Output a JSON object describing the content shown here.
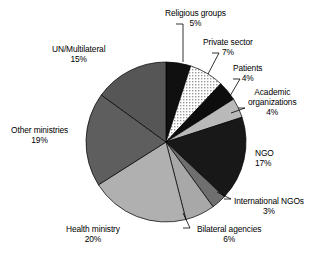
{
  "chart_data": {
    "type": "pie",
    "title": "",
    "subtitle": "",
    "xlabel": "",
    "ylabel": "",
    "legend_position": "none",
    "labels_position": "outside-with-leader-lines",
    "grid": false,
    "total_percent": 100,
    "start_angle_deg": 0,
    "direction": "clockwise",
    "categories": [
      "Religious groups",
      "Private sector",
      "Patients",
      "Academic organizations",
      "NGO",
      "International NGOs",
      "Bilateral agencies",
      "Health ministry",
      "Other ministries",
      "UN/Multilateral"
    ],
    "values": [
      5,
      7,
      4,
      4,
      17,
      3,
      6,
      20,
      19,
      15
    ],
    "value_labels": [
      "5%",
      "7%",
      "4%",
      "4%",
      "17%",
      "3%",
      "6%",
      "20%",
      "19%",
      "15%"
    ],
    "colors": [
      "#101010",
      "#e8e8e8",
      "#0d0d0d",
      "#b9b9b9",
      "#181818",
      "#6f6f6f",
      "#a8a8a8",
      "#b0b0b0",
      "#5e5e5e",
      "#565656"
    ],
    "slice_fill_styles": [
      "solid",
      "stipple",
      "solid",
      "solid",
      "solid",
      "solid",
      "solid",
      "solid",
      "solid",
      "solid"
    ],
    "slices": [
      {
        "label": "Religious groups",
        "percent": 5,
        "value_label": "5%",
        "color": "#101010",
        "fill": "solid"
      },
      {
        "label": "Private sector",
        "percent": 7,
        "value_label": "7%",
        "color": "#e8e8e8",
        "fill": "stipple"
      },
      {
        "label": "Patients",
        "percent": 4,
        "value_label": "4%",
        "color": "#0d0d0d",
        "fill": "solid"
      },
      {
        "label": "Academic organizations",
        "percent": 4,
        "value_label": "4%",
        "color": "#b9b9b9",
        "fill": "solid"
      },
      {
        "label": "NGO",
        "percent": 17,
        "value_label": "17%",
        "color": "#181818",
        "fill": "solid"
      },
      {
        "label": "International NGOs",
        "percent": 3,
        "value_label": "3%",
        "color": "#6f6f6f",
        "fill": "solid"
      },
      {
        "label": "Bilateral agencies",
        "percent": 6,
        "value_label": "6%",
        "color": "#a8a8a8",
        "fill": "solid"
      },
      {
        "label": "Health ministry",
        "percent": 20,
        "value_label": "20%",
        "color": "#b0b0b0",
        "fill": "solid"
      },
      {
        "label": "Other ministries",
        "percent": 19,
        "value_label": "19%",
        "color": "#5e5e5e",
        "fill": "solid"
      },
      {
        "label": "UN/Multilateral",
        "percent": 15,
        "value_label": "15%",
        "color": "#565656",
        "fill": "solid"
      }
    ]
  },
  "labels": {
    "religious_groups": {
      "name": "Religious groups",
      "pct": "5%"
    },
    "private_sector": {
      "name": "Private sector",
      "pct": "7%"
    },
    "patients": {
      "name": "Patients",
      "pct": "4%"
    },
    "academic_organizations": {
      "name_line1": "Academic",
      "name_line2": "organizations",
      "pct": "4%"
    },
    "ngo": {
      "name": "NGO",
      "pct": "17%"
    },
    "international_ngos": {
      "name": "International NGOs",
      "pct": "3%"
    },
    "bilateral_agencies": {
      "name": "Bilateral agencies",
      "pct": "6%"
    },
    "health_ministry": {
      "name": "Health ministry",
      "pct": "20%"
    },
    "other_ministries": {
      "name": "Other ministries",
      "pct": "19%"
    },
    "un_multilateral": {
      "name": "UN/Multilateral",
      "pct": "15%"
    }
  }
}
